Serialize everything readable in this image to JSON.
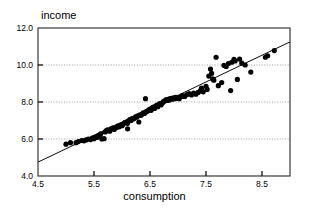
{
  "chart_data": {
    "type": "scatter",
    "title": "",
    "xlabel": "consumption",
    "ylabel": "income",
    "xlim": [
      4.5,
      9.0
    ],
    "ylim": [
      4.0,
      12.0
    ],
    "xticks": [
      "4.5",
      "5.5",
      "6.5",
      "7.5",
      "8.5"
    ],
    "xtick_values": [
      4.5,
      5.5,
      6.5,
      7.5,
      8.5
    ],
    "yticks": [
      "4.0",
      "6.0",
      "8.0",
      "10.0",
      "12.0"
    ],
    "ytick_values": [
      4.0,
      6.0,
      8.0,
      10.0,
      12.0
    ],
    "grid": true,
    "grid_axis": "y",
    "grid_values": [
      6.0,
      8.0,
      10.0
    ],
    "legend": null,
    "marker_color": "#000000",
    "marker_size": 2.6,
    "line_color": "#000000",
    "fit_line": {
      "x": [
        4.5,
        9.0
      ],
      "y": [
        4.75,
        11.25
      ],
      "slope": 1.444,
      "intercept": -1.75
    },
    "series": [
      {
        "name": "observations",
        "points": [
          [
            5.0,
            5.72
          ],
          [
            5.08,
            5.8
          ],
          [
            5.18,
            5.8
          ],
          [
            5.22,
            5.86
          ],
          [
            5.28,
            5.92
          ],
          [
            5.32,
            5.9
          ],
          [
            5.36,
            5.95
          ],
          [
            5.4,
            6.0
          ],
          [
            5.44,
            5.97
          ],
          [
            5.47,
            6.05
          ],
          [
            5.5,
            6.02
          ],
          [
            5.52,
            6.1
          ],
          [
            5.55,
            6.08
          ],
          [
            5.58,
            6.2
          ],
          [
            5.6,
            6.15
          ],
          [
            5.62,
            6.28
          ],
          [
            5.64,
            6.0
          ],
          [
            5.68,
            6.02
          ],
          [
            5.7,
            6.38
          ],
          [
            5.72,
            6.45
          ],
          [
            5.74,
            6.5
          ],
          [
            5.78,
            6.42
          ],
          [
            5.8,
            6.55
          ],
          [
            5.84,
            6.6
          ],
          [
            5.86,
            6.52
          ],
          [
            5.9,
            6.62
          ],
          [
            5.92,
            6.7
          ],
          [
            5.95,
            6.66
          ],
          [
            5.98,
            6.75
          ],
          [
            6.0,
            6.72
          ],
          [
            6.02,
            6.8
          ],
          [
            6.05,
            6.88
          ],
          [
            6.08,
            6.92
          ],
          [
            6.1,
            6.85
          ],
          [
            6.12,
            6.98
          ],
          [
            6.14,
            7.05
          ],
          [
            6.16,
            7.0
          ],
          [
            6.18,
            7.1
          ],
          [
            6.2,
            7.08
          ],
          [
            6.22,
            7.12
          ],
          [
            6.1,
            6.55
          ],
          [
            6.24,
            7.2
          ],
          [
            6.26,
            7.18
          ],
          [
            6.28,
            7.25
          ],
          [
            6.3,
            6.92
          ],
          [
            6.32,
            7.3
          ],
          [
            6.34,
            7.28
          ],
          [
            6.36,
            7.35
          ],
          [
            6.38,
            7.42
          ],
          [
            6.4,
            7.38
          ],
          [
            6.42,
            7.45
          ],
          [
            6.44,
            7.5
          ],
          [
            6.42,
            8.18
          ],
          [
            6.46,
            7.52
          ],
          [
            6.48,
            7.58
          ],
          [
            6.5,
            7.62
          ],
          [
            6.52,
            7.55
          ],
          [
            6.54,
            7.68
          ],
          [
            6.56,
            7.72
          ],
          [
            6.58,
            7.65
          ],
          [
            6.6,
            7.78
          ],
          [
            6.62,
            7.82
          ],
          [
            6.64,
            7.75
          ],
          [
            6.66,
            7.88
          ],
          [
            6.68,
            7.92
          ],
          [
            6.7,
            7.85
          ],
          [
            6.72,
            7.95
          ],
          [
            6.74,
            8.02
          ],
          [
            6.76,
            8.05
          ],
          [
            6.78,
            8.12
          ],
          [
            6.8,
            8.08
          ],
          [
            6.82,
            8.15
          ],
          [
            6.84,
            8.1
          ],
          [
            6.86,
            8.18
          ],
          [
            6.88,
            8.2
          ],
          [
            6.9,
            8.15
          ],
          [
            6.92,
            8.22
          ],
          [
            6.94,
            8.18
          ],
          [
            6.96,
            8.25
          ],
          [
            6.98,
            8.2
          ],
          [
            7.0,
            8.22
          ],
          [
            7.02,
            8.18
          ],
          [
            7.05,
            8.28
          ],
          [
            7.08,
            8.35
          ],
          [
            7.12,
            8.3
          ],
          [
            7.16,
            8.4
          ],
          [
            7.2,
            8.45
          ],
          [
            7.24,
            8.38
          ],
          [
            7.28,
            8.48
          ],
          [
            7.32,
            8.42
          ],
          [
            7.36,
            8.52
          ],
          [
            7.4,
            8.6
          ],
          [
            7.42,
            8.75
          ],
          [
            7.45,
            8.55
          ],
          [
            7.5,
            8.85
          ],
          [
            7.52,
            8.68
          ],
          [
            7.55,
            9.4
          ],
          [
            7.58,
            9.78
          ],
          [
            7.6,
            9.55
          ],
          [
            7.62,
            9.25
          ],
          [
            7.64,
            9.18
          ],
          [
            7.68,
            10.42
          ],
          [
            7.72,
            8.88
          ],
          [
            7.78,
            9.05
          ],
          [
            7.82,
            9.98
          ],
          [
            7.86,
            9.92
          ],
          [
            7.9,
            10.08
          ],
          [
            7.94,
            8.62
          ],
          [
            7.96,
            10.15
          ],
          [
            8.0,
            10.3
          ],
          [
            8.02,
            10.22
          ],
          [
            8.06,
            9.22
          ],
          [
            8.1,
            10.32
          ],
          [
            8.14,
            10.1
          ],
          [
            8.2,
            10.0
          ],
          [
            8.3,
            9.62
          ],
          [
            8.56,
            10.42
          ],
          [
            8.6,
            10.5
          ],
          [
            8.72,
            10.78
          ]
        ]
      }
    ]
  }
}
